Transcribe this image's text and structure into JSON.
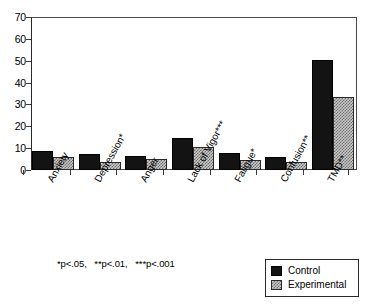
{
  "chart_data": {
    "type": "bar",
    "title": "",
    "subtitle": "",
    "xlabel": "",
    "ylabel": "",
    "ylim": [
      0,
      70
    ],
    "yticks": [
      0,
      10,
      20,
      30,
      40,
      50,
      60,
      70
    ],
    "ytick_labels": [
      "0",
      "10",
      "20",
      "30",
      "40",
      "50",
      "60",
      "70"
    ],
    "grid": false,
    "legend_position": "bottom-right",
    "categories": [
      "Anxiety",
      "Depression*",
      "Anger",
      "Lack of Vigor***",
      "Fatigue*",
      "Confusion**",
      "TMD**"
    ],
    "series": [
      {
        "name": "Control",
        "color": "#131313",
        "pattern": "solid",
        "values": [
          8.5,
          7.5,
          6.5,
          14.5,
          8.0,
          6.0,
          50.5
        ]
      },
      {
        "name": "Experimental",
        "color": "#c9c9c9",
        "pattern": "checkered",
        "values": [
          6.0,
          3.5,
          5.0,
          10.5,
          4.5,
          3.5,
          33.5
        ]
      }
    ],
    "annotations": [
      "*p<.05,   **p<.01,   ***p<.001"
    ]
  },
  "footnote": {
    "text": "*p<.05,   **p<.01,   ***p<.001"
  },
  "legend": {
    "items": [
      {
        "label": "Control",
        "swatch": "solid-black-swatch"
      },
      {
        "label": "Experimental",
        "swatch": "checkered-gray-swatch"
      }
    ]
  }
}
